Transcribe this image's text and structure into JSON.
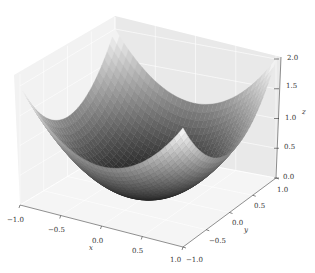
{
  "chart_data": {
    "type": "surface3d",
    "title": "",
    "function": "z = x^2 + y^2",
    "colormap": "gray",
    "xlabel": "x",
    "ylabel": "y",
    "zlabel": "z",
    "xlim": [
      -1.0,
      1.0
    ],
    "ylim": [
      -1.0,
      1.0
    ],
    "zlim": [
      0.0,
      2.0
    ],
    "xticks": [
      "-1.0",
      "-0.5",
      "0.0",
      "0.5",
      "1.0"
    ],
    "yticks": [
      "-1.0",
      "-0.5",
      "0.0",
      "0.5",
      "1.0"
    ],
    "zticks": [
      "0.0",
      "0.5",
      "1.0",
      "1.5",
      "2.0"
    ],
    "grid": true,
    "corner_values": [
      {
        "x": -1.0,
        "y": -1.0,
        "z": 2.0
      },
      {
        "x": -1.0,
        "y": 1.0,
        "z": 2.0
      },
      {
        "x": 1.0,
        "y": -1.0,
        "z": 2.0
      },
      {
        "x": 1.0,
        "y": 1.0,
        "z": 2.0
      }
    ],
    "minimum": {
      "x": 0.0,
      "y": 0.0,
      "z": 0.0
    }
  }
}
